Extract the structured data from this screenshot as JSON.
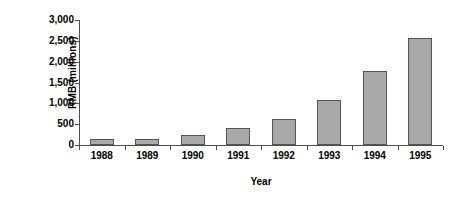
{
  "chart_data": {
    "type": "bar",
    "title": "",
    "xlabel": "Year",
    "ylabel": "RMB (millions)",
    "categories": [
      "1988",
      "1989",
      "1990",
      "1991",
      "1992",
      "1993",
      "1994",
      "1995"
    ],
    "values": [
      140,
      140,
      250,
      420,
      620,
      1070,
      1780,
      2580
    ],
    "ylim": [
      0,
      3000
    ],
    "yticks": [
      0,
      500,
      1000,
      1500,
      2000,
      2500,
      3000
    ],
    "ytick_labels": [
      "0",
      "500",
      "1,000",
      "1,500",
      "2,000",
      "2,500",
      "3,000"
    ],
    "grid": false,
    "legend": false,
    "bar_color": "#a9a9a9",
    "bar_edge_color": "#555555",
    "axis_color": "#4d4d4d",
    "background_color": "#ffffff"
  }
}
